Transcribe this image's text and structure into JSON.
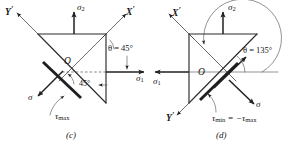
{
  "figure": {
    "panels": [
      {
        "id": "c",
        "caption": "(c)",
        "origin_label": "O",
        "axes": [
          {
            "name": "y-prime-axis",
            "label": "Y",
            "prime": "′"
          },
          {
            "name": "x-prime-axis",
            "label": "X",
            "prime": "′"
          }
        ],
        "stresses": {
          "sigma2": {
            "symbol": "σ",
            "sub": "2"
          },
          "sigma1": {
            "symbol": "σ",
            "sub": "1"
          },
          "sigma_normal": {
            "symbol": "σ",
            "sub": ""
          },
          "tau_max": {
            "symbol": "τ",
            "sub": "max"
          }
        },
        "angles": {
          "theta": "θ = 45°",
          "theta_symbol": "θ",
          "theta_value": "45°",
          "inner": "45°"
        }
      },
      {
        "id": "d",
        "caption": "(d)",
        "origin_label": "O",
        "axes": [
          {
            "name": "x-prime-axis",
            "label": "X",
            "prime": "′"
          },
          {
            "name": "y-prime-axis",
            "label": "Y",
            "prime": "′"
          }
        ],
        "stresses": {
          "sigma2": {
            "symbol": "σ",
            "sub": "2"
          },
          "sigma1": {
            "symbol": "σ",
            "sub": "1"
          },
          "sigma_normal": {
            "symbol": "σ",
            "sub": ""
          },
          "tau_min_eq": {
            "text": "τ",
            "sub1": "min",
            "eq": " = −",
            "text2": "τ",
            "sub2": "max"
          }
        },
        "angles": {
          "theta": "θ = 135°",
          "theta_symbol": "θ",
          "theta_value": "135°"
        }
      }
    ],
    "colors": {
      "ink": "#202020",
      "background": "#ffffff",
      "thin_line": "#3a3a3a",
      "dashed_line": "#555555"
    }
  }
}
